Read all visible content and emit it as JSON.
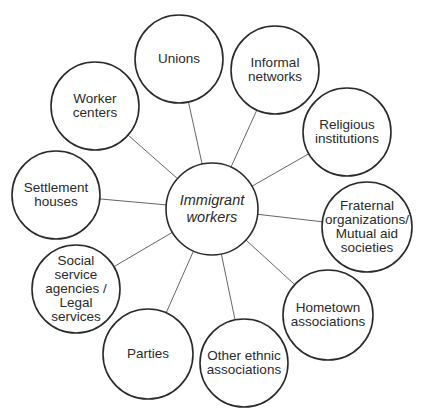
{
  "diagram": {
    "type": "hub-and-spoke",
    "center": {
      "id": "immigrant-workers",
      "label": "Immigrant\nworkers",
      "x": 212,
      "y": 209,
      "r": 46
    },
    "nodes": [
      {
        "id": "unions",
        "label": "Unions",
        "x": 179,
        "y": 59,
        "r": 44
      },
      {
        "id": "informal-networks",
        "label": "Informal\nnetworks",
        "x": 275,
        "y": 70,
        "r": 44
      },
      {
        "id": "religious-institutions",
        "label": "Religious\ninstitutions",
        "x": 347,
        "y": 132,
        "r": 44
      },
      {
        "id": "fraternal-organizations",
        "label": "Fraternal\norganizations/\nMutual aid\nsocieties",
        "x": 367,
        "y": 227,
        "r": 45
      },
      {
        "id": "hometown-associations",
        "label": "Hometown\nassociations",
        "x": 328,
        "y": 315,
        "r": 45
      },
      {
        "id": "other-ethnic-associations",
        "label": "Other ethnic\nassociations",
        "x": 244,
        "y": 363,
        "r": 44
      },
      {
        "id": "parties",
        "label": "Parties",
        "x": 148,
        "y": 354,
        "r": 45
      },
      {
        "id": "social-service-agencies",
        "label": "Social\nservice\nagencies /\nLegal\nservices",
        "x": 76,
        "y": 289,
        "r": 44
      },
      {
        "id": "settlement-houses",
        "label": "Settlement\nhouses",
        "x": 56,
        "y": 195,
        "r": 44
      },
      {
        "id": "worker-centers",
        "label": "Worker\ncenters",
        "x": 95,
        "y": 106,
        "r": 44
      }
    ],
    "edges": [
      [
        "immigrant-workers",
        "unions"
      ],
      [
        "immigrant-workers",
        "informal-networks"
      ],
      [
        "immigrant-workers",
        "religious-institutions"
      ],
      [
        "immigrant-workers",
        "fraternal-organizations"
      ],
      [
        "immigrant-workers",
        "hometown-associations"
      ],
      [
        "immigrant-workers",
        "other-ethnic-associations"
      ],
      [
        "immigrant-workers",
        "parties"
      ],
      [
        "immigrant-workers",
        "social-service-agencies"
      ],
      [
        "immigrant-workers",
        "settlement-houses"
      ],
      [
        "immigrant-workers",
        "worker-centers"
      ]
    ],
    "colors": {
      "stroke": "#2a2a2a",
      "edge": "#555555",
      "text": "#2a2a2a",
      "background": "#ffffff"
    }
  }
}
